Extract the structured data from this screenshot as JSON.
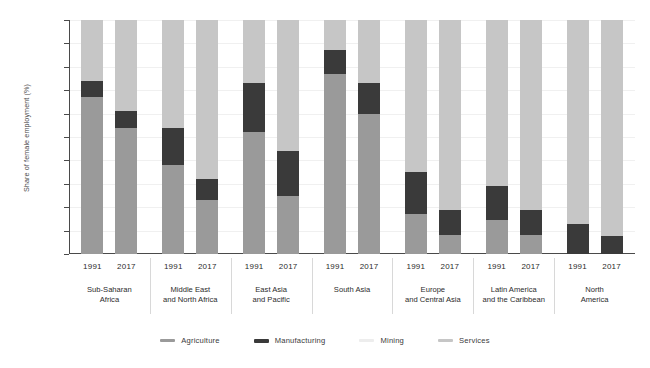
{
  "chart_data": {
    "type": "bar",
    "stacked": true,
    "title": "",
    "subtitle": "",
    "xlabel": "",
    "ylabel": "Share of female employment (%)",
    "ylim": [
      0,
      100
    ],
    "yticks": [
      0,
      10,
      20,
      30,
      40,
      50,
      60,
      70,
      80,
      90,
      100
    ],
    "grid": true,
    "legend_position": "bottom",
    "series": [
      {
        "name": "Agriculture",
        "color": "#9a9a9a"
      },
      {
        "name": "Manufacturing",
        "color": "#3a3a3a"
      },
      {
        "name": "Mining",
        "color": "#ededed"
      },
      {
        "name": "Services",
        "color": "#c6c6c6"
      }
    ],
    "groups": [
      {
        "label": "Sub-Saharan Africa",
        "label_lines": [
          "Sub-Saharan",
          "Africa"
        ],
        "bars": [
          {
            "year": "1991",
            "Agriculture": 67.0,
            "Manufacturing": 7.0,
            "Mining": 0,
            "Services": 26.0
          },
          {
            "year": "2017",
            "Agriculture": 54.0,
            "Manufacturing": 7.0,
            "Mining": 0,
            "Services": 39.0
          }
        ]
      },
      {
        "label": "Middle East and North Africa",
        "label_lines": [
          "Middle East",
          "and North Africa"
        ],
        "bars": [
          {
            "year": "1991",
            "Agriculture": 38.0,
            "Manufacturing": 16.0,
            "Mining": 0,
            "Services": 46.0
          },
          {
            "year": "2017",
            "Agriculture": 23.0,
            "Manufacturing": 9.0,
            "Mining": 0,
            "Services": 68.0
          }
        ]
      },
      {
        "label": "East Asia and Pacific",
        "label_lines": [
          "East Asia",
          "and Pacific"
        ],
        "bars": [
          {
            "year": "1991",
            "Agriculture": 52.0,
            "Manufacturing": 21.0,
            "Mining": 0,
            "Services": 27.0
          },
          {
            "year": "2017",
            "Agriculture": 25.0,
            "Manufacturing": 19.0,
            "Mining": 0,
            "Services": 56.0
          }
        ]
      },
      {
        "label": "South Asia",
        "label_lines": [
          "South Asia"
        ],
        "bars": [
          {
            "year": "1991",
            "Agriculture": 77.0,
            "Manufacturing": 10.0,
            "Mining": 0,
            "Services": 13.0
          },
          {
            "year": "2017",
            "Agriculture": 60.0,
            "Manufacturing": 13.0,
            "Mining": 0,
            "Services": 27.0
          }
        ]
      },
      {
        "label": "Europe and Central Asia",
        "label_lines": [
          "Europe",
          "and Central Asia"
        ],
        "bars": [
          {
            "year": "1991",
            "Agriculture": 17.0,
            "Manufacturing": 18.0,
            "Mining": 0,
            "Services": 65.0
          },
          {
            "year": "2017",
            "Agriculture": 8.0,
            "Manufacturing": 11.0,
            "Mining": 0,
            "Services": 81.0
          }
        ]
      },
      {
        "label": "Latin America and the Caribbean",
        "label_lines": [
          "Latin America",
          "and the Caribbean"
        ],
        "bars": [
          {
            "year": "1991",
            "Agriculture": 14.5,
            "Manufacturing": 14.5,
            "Mining": 0,
            "Services": 71.0
          },
          {
            "year": "2017",
            "Agriculture": 8.0,
            "Manufacturing": 11.0,
            "Mining": 0,
            "Services": 81.0
          }
        ]
      },
      {
        "label": "North America",
        "label_lines": [
          "North",
          "America"
        ],
        "bars": [
          {
            "year": "1991",
            "Agriculture": 0.0,
            "Manufacturing": 13.0,
            "Mining": 0,
            "Services": 87.0
          },
          {
            "year": "2017",
            "Agriculture": 0.0,
            "Manufacturing": 7.5,
            "Mining": 0,
            "Services": 92.5
          }
        ]
      }
    ]
  }
}
